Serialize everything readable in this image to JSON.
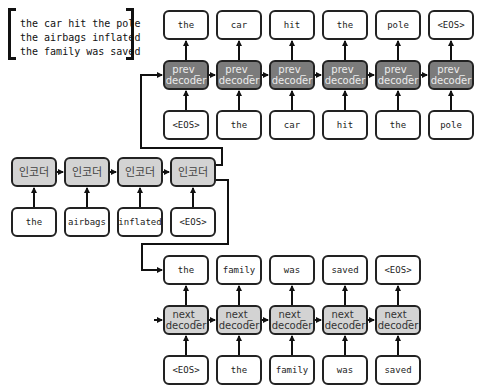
{
  "legend": {
    "lines": [
      "the car hit the pole",
      "the airbags inflated",
      "the family was saved"
    ]
  },
  "colors": {
    "prev_decoder_fill": "#7b7b7b",
    "next_decoder_fill": "#d3d3d3",
    "encoder_fill": "#d3d3d3",
    "token_fill": "#ffffff",
    "stroke": "#222222"
  },
  "prev_decoder": {
    "cell_label": "prev_\ndecoder",
    "outputs": [
      "the",
      "car",
      "hit",
      "the",
      "pole",
      "<EOS>"
    ],
    "inputs": [
      "<EOS>",
      "the",
      "car",
      "hit",
      "the",
      "pole"
    ]
  },
  "encoder": {
    "cell_label": "인코더",
    "inputs": [
      "the",
      "airbags",
      "inflated",
      "<EOS>"
    ]
  },
  "next_decoder": {
    "cell_label": "next_\ndecoder",
    "outputs": [
      "the",
      "family",
      "was",
      "saved",
      "<EOS>"
    ],
    "inputs": [
      "<EOS>",
      "the",
      "family",
      "was",
      "saved"
    ]
  }
}
